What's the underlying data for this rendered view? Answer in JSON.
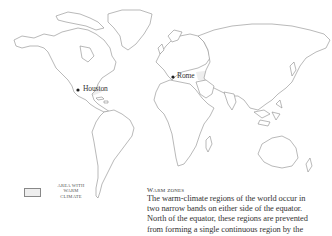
{
  "map": {
    "title": "World map of warm-climate regions",
    "colors": {
      "land_fill": "#ffffff",
      "coast_stroke": "#8a8a8a",
      "warm_area_fill": "#eeeeee",
      "marker": "#1e1e1e"
    },
    "cities": [
      {
        "name": "Houston",
        "x": 78,
        "y": 90
      },
      {
        "name": "Rome",
        "x": 173,
        "y": 77
      }
    ]
  },
  "legend": {
    "swatch_color": "#eeeeee",
    "label": "AREA WITH WARM CLIMATE",
    "label_lines": [
      "AREA WITH",
      "WARM",
      "CLIMATE"
    ]
  },
  "caption": {
    "title": "Warm zones",
    "lines": [
      "The warm-climate regions of the world occur in",
      "two narrow bands on either side of the equator.",
      "North of the equator, these regions are prevented",
      "from forming a single continuous region by the"
    ]
  }
}
